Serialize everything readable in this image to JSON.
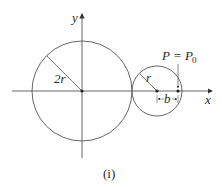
{
  "diagram": {
    "type": "geometry",
    "caption": "(i)",
    "axes": {
      "x_label": "x",
      "y_label": "y"
    },
    "large_circle": {
      "radius_label": "2r",
      "center": "origin"
    },
    "small_circle": {
      "radius_label": "r"
    },
    "point": {
      "label_main": "P = P",
      "label_sub": "0"
    },
    "distance_label": "b",
    "colors": {
      "stroke": "#555555",
      "text": "#2a2a2a",
      "background": "#ffffff"
    }
  }
}
